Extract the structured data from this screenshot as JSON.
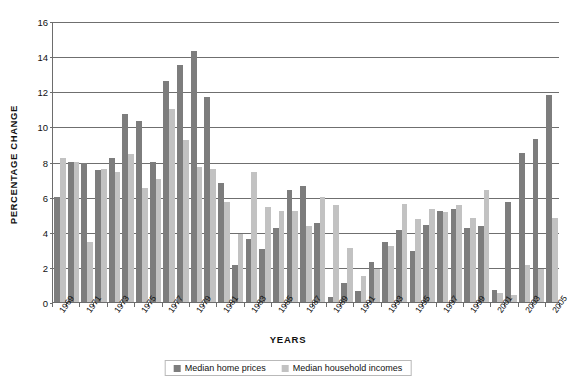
{
  "chart_data": {
    "type": "bar",
    "title": "",
    "xlabel": "YEARS",
    "ylabel": "PERCENTAGE CHANGE",
    "ylim": [
      0,
      16
    ],
    "ytick_step": 2,
    "yticks": [
      0,
      2,
      4,
      6,
      8,
      10,
      12,
      14,
      16
    ],
    "grid": true,
    "legend_position": "bottom",
    "categories": [
      "1969",
      "1970",
      "1971",
      "1972",
      "1973",
      "1974",
      "1975",
      "1976",
      "1977",
      "1978",
      "1979",
      "1980",
      "1981",
      "1982",
      "1983",
      "1984",
      "1985",
      "1986",
      "1987",
      "1988",
      "1989",
      "1990",
      "1991",
      "1992",
      "1993",
      "1994",
      "1995",
      "1996",
      "1997",
      "1998",
      "1999",
      "2000",
      "2001",
      "2002",
      "2003",
      "2004",
      "2005"
    ],
    "tick_labels": [
      "1969",
      "",
      "1971",
      "",
      "1973",
      "",
      "1975",
      "",
      "1977",
      "",
      "1979",
      "",
      "1981",
      "",
      "1983",
      "",
      "1985",
      "",
      "1987",
      "",
      "1989",
      "",
      "1991",
      "",
      "1993",
      "",
      "1995",
      "",
      "1997",
      "",
      "1999",
      "",
      "2001",
      "",
      "2003",
      "",
      "2005"
    ],
    "series": [
      {
        "name": "Median home prices",
        "color": "#7d7d7d",
        "values": [
          6.0,
          8.0,
          7.9,
          7.5,
          8.2,
          10.7,
          10.3,
          8.0,
          12.6,
          13.5,
          14.3,
          11.7,
          6.8,
          2.1,
          3.6,
          3.0,
          4.2,
          6.4,
          6.6,
          4.5,
          0.3,
          1.1,
          0.6,
          2.3,
          3.4,
          4.1,
          2.9,
          4.4,
          5.2,
          5.3,
          4.2,
          4.3,
          0.7,
          5.7,
          8.5,
          9.3,
          11.8
        ]
      },
      {
        "name": "Median household incomes",
        "color": "#c2c2c2",
        "values": [
          8.2,
          8.0,
          3.4,
          7.6,
          7.4,
          8.4,
          6.5,
          7.0,
          11.0,
          9.2,
          7.7,
          7.6,
          5.7,
          3.9,
          7.4,
          5.4,
          5.2,
          5.2,
          4.3,
          6.0,
          5.5,
          3.1,
          1.5,
          1.9,
          3.2,
          5.6,
          4.7,
          5.3,
          5.1,
          5.5,
          4.8,
          6.4,
          0.5,
          0.4,
          2.1,
          1.9,
          4.8
        ]
      }
    ]
  },
  "legend": {
    "items": [
      {
        "label": "Median home prices",
        "swatch": "dark"
      },
      {
        "label": "Median household incomes",
        "swatch": "light"
      }
    ]
  }
}
